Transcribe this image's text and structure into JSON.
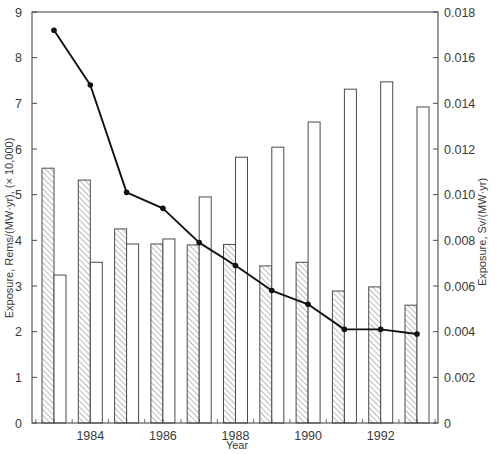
{
  "chart_data": {
    "type": "bar",
    "title": "",
    "xlabel": "Year",
    "ylabel": "Exposure, Rems/(MW·yr), (× 10,000)",
    "ylabel_right": "Exposure, Sv/(MW·yr)",
    "ylim": [
      0,
      9
    ],
    "ylim_right": [
      0,
      0.018
    ],
    "grid": false,
    "legend": null,
    "categories": [
      1983,
      1984,
      1985,
      1986,
      1987,
      1988,
      1989,
      1990,
      1991,
      1992,
      1993
    ],
    "xtick_labels": [
      "1984",
      "1986",
      "1988",
      "1990",
      "1992"
    ],
    "xtick_values": [
      1984,
      1986,
      1988,
      1990,
      1992
    ],
    "ytick_labels_left": [
      "0",
      "1",
      "2",
      "3",
      "4",
      "5",
      "6",
      "7",
      "8",
      "9"
    ],
    "ytick_values_left": [
      0,
      1,
      2,
      3,
      4,
      5,
      6,
      7,
      8,
      9
    ],
    "ytick_labels_right": [
      "0",
      "0.002",
      "0.004",
      "0.006",
      "0.008",
      "0.010",
      "0.012",
      "0.014",
      "0.016",
      "0.018"
    ],
    "ytick_values_right": [
      0,
      0.002,
      0.004,
      0.006,
      0.008,
      0.01,
      0.012,
      0.014,
      0.016,
      0.018
    ],
    "series": [
      {
        "name": "Hatched bars",
        "type": "bar",
        "axis": "left",
        "style": "hatched",
        "values": [
          5.58,
          5.32,
          4.25,
          3.92,
          3.9,
          3.91,
          3.44,
          3.52,
          2.89,
          2.98,
          2.58
        ]
      },
      {
        "name": "Open bars",
        "type": "bar",
        "axis": "left",
        "style": "open",
        "values": [
          3.24,
          3.52,
          3.92,
          4.03,
          4.95,
          5.82,
          6.04,
          6.59,
          7.31,
          7.47,
          6.92
        ]
      },
      {
        "name": "Line",
        "type": "line",
        "axis": "right",
        "marker": "dot",
        "values": [
          0.0172,
          0.0148,
          0.0101,
          0.0094,
          0.0079,
          0.0069,
          0.0058,
          0.0052,
          0.0041,
          0.0041,
          0.0039
        ]
      }
    ],
    "colors": {
      "axis": "#4a4a4a",
      "bar_outline": "#4a4a4a",
      "hatch": "#6a6a6a",
      "line": "#111111",
      "text": "#3a3a3a"
    }
  }
}
